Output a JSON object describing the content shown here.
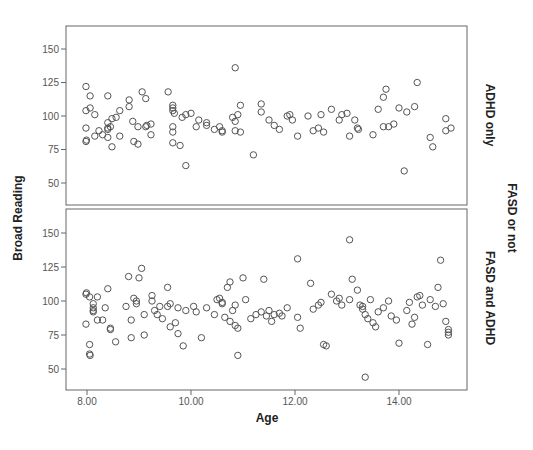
{
  "chart_data": {
    "type": "scatter",
    "title": "",
    "xlabel": "Age",
    "ylabel": "Broad Reading",
    "facet_label": "FASD or not",
    "xlim": [
      7.6,
      15.2
    ],
    "ylim": [
      32,
      166
    ],
    "x_ticks": [
      "8.00",
      "10.00",
      "12.00",
      "14.00"
    ],
    "y_ticks": [
      "50",
      "75",
      "100",
      "125",
      "150"
    ],
    "grid": false,
    "legend": "none",
    "panels": [
      {
        "name": "ADHD only",
        "points": [
          [
            7.98,
            122
          ],
          [
            8.06,
            115
          ],
          [
            8.4,
            115
          ],
          [
            7.98,
            104
          ],
          [
            8.06,
            106
          ],
          [
            8.15,
            101
          ],
          [
            7.98,
            91
          ],
          [
            7.98,
            81
          ],
          [
            7.99,
            82
          ],
          [
            8.15,
            85
          ],
          [
            8.23,
            89
          ],
          [
            8.3,
            86
          ],
          [
            8.4,
            84
          ],
          [
            8.4,
            90
          ],
          [
            8.4,
            95
          ],
          [
            8.48,
            98
          ],
          [
            8.56,
            99
          ],
          [
            8.63,
            104
          ],
          [
            8.4,
            91
          ],
          [
            8.45,
            92
          ],
          [
            8.63,
            85
          ],
          [
            8.48,
            77
          ],
          [
            8.81,
            112
          ],
          [
            8.81,
            107
          ],
          [
            9.06,
            118
          ],
          [
            9.13,
            113
          ],
          [
            8.88,
            96
          ],
          [
            8.98,
            92
          ],
          [
            9.13,
            92
          ],
          [
            9.15,
            93
          ],
          [
            9.23,
            94
          ],
          [
            9.23,
            86
          ],
          [
            8.9,
            81
          ],
          [
            8.98,
            79
          ],
          [
            9.56,
            118
          ],
          [
            9.65,
            104
          ],
          [
            9.65,
            106
          ],
          [
            9.65,
            108
          ],
          [
            9.68,
            102
          ],
          [
            9.65,
            92
          ],
          [
            9.65,
            88
          ],
          [
            9.65,
            80
          ],
          [
            9.83,
            99
          ],
          [
            9.79,
            78
          ],
          [
            9.9,
            63
          ],
          [
            9.9,
            101
          ],
          [
            10.0,
            102
          ],
          [
            10.1,
            92
          ],
          [
            10.15,
            97
          ],
          [
            10.3,
            95
          ],
          [
            10.3,
            93
          ],
          [
            10.45,
            90
          ],
          [
            10.55,
            92
          ],
          [
            10.6,
            89
          ],
          [
            10.6,
            88
          ],
          [
            10.85,
            136
          ],
          [
            10.8,
            99
          ],
          [
            10.85,
            96
          ],
          [
            10.9,
            101
          ],
          [
            10.95,
            108
          ],
          [
            10.85,
            89
          ],
          [
            10.95,
            88
          ],
          [
            11.2,
            71
          ],
          [
            11.35,
            109
          ],
          [
            11.35,
            103
          ],
          [
            11.5,
            97
          ],
          [
            11.6,
            93
          ],
          [
            11.7,
            90
          ],
          [
            11.85,
            100
          ],
          [
            11.9,
            101
          ],
          [
            11.95,
            97
          ],
          [
            12.05,
            85
          ],
          [
            12.25,
            100
          ],
          [
            12.35,
            89
          ],
          [
            12.45,
            91
          ],
          [
            12.5,
            101
          ],
          [
            12.55,
            88
          ],
          [
            12.7,
            105
          ],
          [
            12.85,
            97
          ],
          [
            12.9,
            101
          ],
          [
            13.0,
            102
          ],
          [
            13.05,
            85
          ],
          [
            13.15,
            97
          ],
          [
            13.2,
            91
          ],
          [
            13.22,
            90
          ],
          [
            13.5,
            86
          ],
          [
            13.6,
            105
          ],
          [
            13.7,
            114
          ],
          [
            13.75,
            120
          ],
          [
            13.7,
            92
          ],
          [
            13.8,
            92
          ],
          [
            13.9,
            94
          ],
          [
            14.0,
            106
          ],
          [
            14.1,
            59
          ],
          [
            14.15,
            103
          ],
          [
            14.3,
            107
          ],
          [
            14.35,
            125
          ],
          [
            14.6,
            84
          ],
          [
            14.65,
            77
          ],
          [
            14.9,
            98
          ],
          [
            14.9,
            89
          ],
          [
            15.0,
            91
          ]
        ]
      },
      {
        "name": "FASD and ADHD",
        "points": [
          [
            7.98,
            105
          ],
          [
            7.99,
            106
          ],
          [
            8.05,
            103
          ],
          [
            8.12,
            98
          ],
          [
            8.12,
            95
          ],
          [
            8.12,
            93
          ],
          [
            8.12,
            92
          ],
          [
            8.2,
            103
          ],
          [
            7.98,
            83
          ],
          [
            8.05,
            68
          ],
          [
            8.05,
            61
          ],
          [
            8.06,
            60
          ],
          [
            8.2,
            86
          ],
          [
            8.3,
            86
          ],
          [
            8.35,
            95
          ],
          [
            8.4,
            109
          ],
          [
            8.45,
            80
          ],
          [
            8.45,
            79
          ],
          [
            8.55,
            70
          ],
          [
            8.75,
            96
          ],
          [
            8.8,
            118
          ],
          [
            8.85,
            86
          ],
          [
            8.85,
            73
          ],
          [
            8.9,
            102
          ],
          [
            8.95,
            100
          ],
          [
            8.95,
            98
          ],
          [
            9.0,
            117
          ],
          [
            9.05,
            124
          ],
          [
            9.1,
            90
          ],
          [
            9.1,
            75
          ],
          [
            9.25,
            104
          ],
          [
            9.25,
            100
          ],
          [
            9.3,
            93
          ],
          [
            9.35,
            90
          ],
          [
            9.4,
            96
          ],
          [
            9.45,
            87
          ],
          [
            9.55,
            110
          ],
          [
            9.55,
            96
          ],
          [
            9.6,
            98
          ],
          [
            9.6,
            81
          ],
          [
            9.7,
            84
          ],
          [
            9.75,
            95
          ],
          [
            9.75,
            76
          ],
          [
            9.85,
            67
          ],
          [
            9.9,
            93
          ],
          [
            10.05,
            96
          ],
          [
            10.1,
            92
          ],
          [
            10.2,
            73
          ],
          [
            10.3,
            95
          ],
          [
            10.45,
            90
          ],
          [
            10.5,
            101
          ],
          [
            10.55,
            102
          ],
          [
            10.6,
            99
          ],
          [
            10.6,
            98
          ],
          [
            10.65,
            88
          ],
          [
            10.7,
            110
          ],
          [
            10.75,
            114
          ],
          [
            10.75,
            85
          ],
          [
            10.8,
            93
          ],
          [
            10.85,
            97
          ],
          [
            10.85,
            82
          ],
          [
            10.9,
            80
          ],
          [
            10.9,
            60
          ],
          [
            11.0,
            117
          ],
          [
            11.05,
            101
          ],
          [
            11.15,
            87
          ],
          [
            11.25,
            90
          ],
          [
            11.35,
            92
          ],
          [
            11.4,
            116
          ],
          [
            11.45,
            89
          ],
          [
            11.5,
            93
          ],
          [
            11.55,
            85
          ],
          [
            11.6,
            90
          ],
          [
            11.7,
            91
          ],
          [
            11.75,
            89
          ],
          [
            11.85,
            95
          ],
          [
            12.05,
            131
          ],
          [
            12.05,
            88
          ],
          [
            12.1,
            80
          ],
          [
            12.3,
            113
          ],
          [
            12.35,
            94
          ],
          [
            12.45,
            97
          ],
          [
            12.5,
            99
          ],
          [
            12.55,
            68
          ],
          [
            12.6,
            67
          ],
          [
            12.7,
            105
          ],
          [
            12.8,
            100
          ],
          [
            12.85,
            102
          ],
          [
            12.9,
            97
          ],
          [
            13.05,
            145
          ],
          [
            13.05,
            101
          ],
          [
            13.1,
            116
          ],
          [
            13.2,
            108
          ],
          [
            13.25,
            97
          ],
          [
            13.3,
            96
          ],
          [
            13.3,
            94
          ],
          [
            13.35,
            44
          ],
          [
            13.35,
            90
          ],
          [
            13.4,
            87
          ],
          [
            13.45,
            101
          ],
          [
            13.5,
            84
          ],
          [
            13.55,
            81
          ],
          [
            13.6,
            92
          ],
          [
            13.7,
            95
          ],
          [
            13.8,
            100
          ],
          [
            13.85,
            89
          ],
          [
            13.95,
            86
          ],
          [
            14.0,
            69
          ],
          [
            14.15,
            93
          ],
          [
            14.2,
            99
          ],
          [
            14.25,
            83
          ],
          [
            14.3,
            88
          ],
          [
            14.35,
            103
          ],
          [
            14.4,
            104
          ],
          [
            14.45,
            97
          ],
          [
            14.55,
            68
          ],
          [
            14.6,
            101
          ],
          [
            14.7,
            96
          ],
          [
            14.75,
            110
          ],
          [
            14.8,
            130
          ],
          [
            14.85,
            98
          ],
          [
            14.9,
            85
          ],
          [
            14.95,
            79
          ],
          [
            14.95,
            77
          ],
          [
            14.95,
            75
          ]
        ]
      }
    ]
  }
}
